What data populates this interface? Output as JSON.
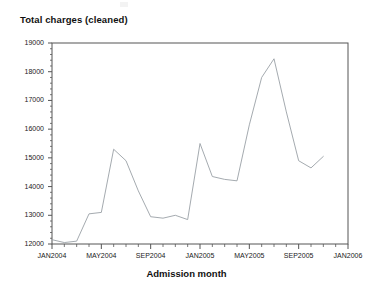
{
  "chart_data": {
    "type": "line",
    "title": "Total charges (cleaned)",
    "xlabel": "Admission month",
    "ylabel": "",
    "ylim": [
      12000,
      19000
    ],
    "ytick_step": 1000,
    "yticks": [
      12000,
      13000,
      14000,
      15000,
      16000,
      17000,
      18000,
      19000
    ],
    "ytick_labels": [
      "12000",
      "13000",
      "14000",
      "15000",
      "16000",
      "17000",
      "18000",
      "19000"
    ],
    "xlim": [
      "JAN2004",
      "JAN2006"
    ],
    "xticks": [
      "JAN2004",
      "MAY2004",
      "SEP2004",
      "JAN2005",
      "MAY2005",
      "SEP2005",
      "JAN2006"
    ],
    "xtick_labels": [
      "JAN2004",
      "MAY2004",
      "SEP2004",
      "JAN2005",
      "MAY2005",
      "SEP2005",
      "JAN2006"
    ],
    "minor_xticks_per_major": 4,
    "minor_yticks_per_major": 5,
    "grid": false,
    "legend": null,
    "line_color": "#9aa0a6",
    "frame_color": "#555555",
    "markers": false,
    "x": [
      "JAN2004",
      "FEB2004",
      "MAR2004",
      "APR2004",
      "MAY2004",
      "JUN2004",
      "JUL2004",
      "AUG2004",
      "SEP2004",
      "OCT2004",
      "NOV2004",
      "DEC2004",
      "JAN2005",
      "FEB2005",
      "MAR2005",
      "APR2005",
      "MAY2005",
      "JUN2005",
      "JUL2005",
      "AUG2005",
      "SEP2005",
      "OCT2005",
      "NOV2005"
    ],
    "values": [
      12150,
      12050,
      12100,
      13050,
      13100,
      15300,
      14900,
      13850,
      12950,
      12900,
      13000,
      12850,
      15500,
      14350,
      14250,
      14200,
      16150,
      17800,
      18450,
      16600,
      14900,
      14650,
      15050
    ],
    "series": [
      {
        "name": "Total charges (cleaned)",
        "values": [
          12150,
          12050,
          12100,
          13050,
          13100,
          15300,
          14900,
          13850,
          12950,
          12900,
          13000,
          12850,
          15500,
          14350,
          14250,
          14200,
          16150,
          17800,
          18450,
          16600,
          14900,
          14650,
          15050
        ]
      }
    ],
    "annotations": []
  }
}
